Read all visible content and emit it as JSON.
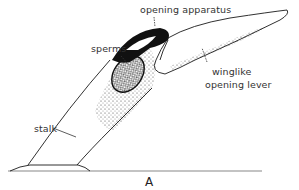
{
  "figure": {
    "panel_label": "A",
    "labels": {
      "opening_apparatus": "opening apparatus",
      "sperms": "sperms",
      "winglike_line1": "winglike",
      "winglike_line2": "opening lever",
      "stalk": "stalk"
    },
    "colors": {
      "ink": "#1a1a1a",
      "text": "#333333",
      "ground": "#888888",
      "background": "#ffffff"
    }
  }
}
